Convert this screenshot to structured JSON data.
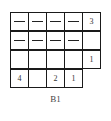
{
  "figure": {
    "label": "B1",
    "grid": {
      "columns": 5,
      "rows": [
        {
          "cells": [
            "—",
            "—",
            "—",
            "—",
            "3"
          ]
        },
        {
          "cells": [
            "—",
            "—",
            "—",
            "—",
            ""
          ]
        },
        {
          "cells": [
            "",
            "",
            "",
            "",
            "1"
          ]
        },
        {
          "cells": [
            "4",
            "",
            "2",
            "1"
          ]
        }
      ]
    }
  }
}
